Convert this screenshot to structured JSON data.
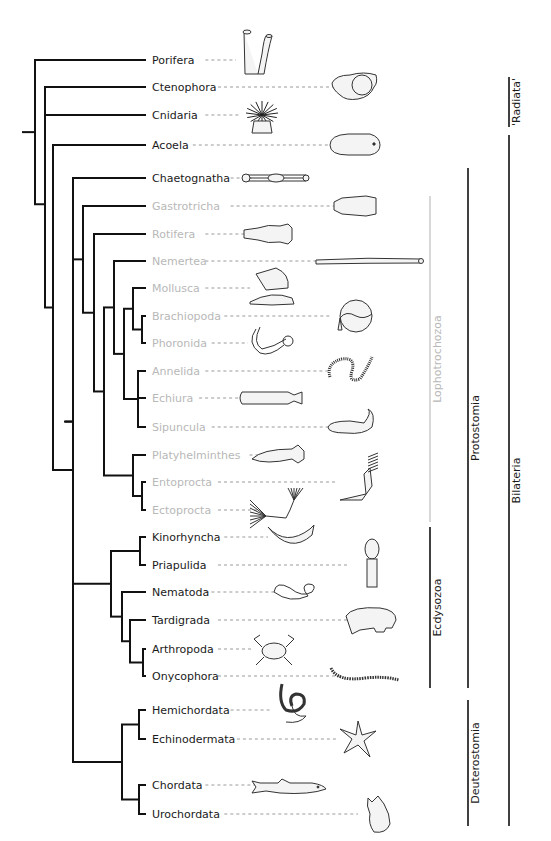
{
  "figure": {
    "type": "phylogenetic-tree",
    "colors": {
      "branch": "#111111",
      "label_dark": "#1a1a1a",
      "label_lophotrochozoa": "#b8b8b8",
      "leader": "#9a9a9a",
      "clade_bar": "#111111",
      "lophotrochozoa_bar": "#d8d8d8",
      "organism_outline": "#333333",
      "organism_fill": "#f4f4f4"
    },
    "taxa": [
      {
        "name": "Porifera",
        "group": "outgroup",
        "organism": "sponge-icon"
      },
      {
        "name": "Ctenophora",
        "group": "outgroup",
        "organism": "comb-jelly-icon"
      },
      {
        "name": "Cnidaria",
        "group": "outgroup",
        "organism": "sea-anemone-icon"
      },
      {
        "name": "Acoela",
        "group": "bilateria",
        "organism": "acoel-flatworm-icon"
      },
      {
        "name": "Chaetognatha",
        "group": "protostomia",
        "organism": "arrow-worm-icon"
      },
      {
        "name": "Gastrotricha",
        "group": "lophotrochozoa",
        "organism": "gastrotrich-icon"
      },
      {
        "name": "Rotifera",
        "group": "lophotrochozoa",
        "organism": "rotifer-icon"
      },
      {
        "name": "Nemertea",
        "group": "lophotrochozoa",
        "organism": "ribbon-worm-icon"
      },
      {
        "name": "Mollusca",
        "group": "lophotrochozoa",
        "organism": "snail-icon"
      },
      {
        "name": "Brachiopoda",
        "group": "lophotrochozoa",
        "organism": "lamp-shell-icon"
      },
      {
        "name": "Phoronida",
        "group": "lophotrochozoa",
        "organism": "horseshoe-worm-icon"
      },
      {
        "name": "Annelida",
        "group": "lophotrochozoa",
        "organism": "segmented-worm-icon"
      },
      {
        "name": "Echiura",
        "group": "lophotrochozoa",
        "organism": "spoon-worm-icon"
      },
      {
        "name": "Sipuncula",
        "group": "lophotrochozoa",
        "organism": "peanut-worm-icon"
      },
      {
        "name": "Platyhelminthes",
        "group": "lophotrochozoa",
        "organism": "flatworm-icon"
      },
      {
        "name": "Entoprocta",
        "group": "lophotrochozoa",
        "organism": "entoproct-icon"
      },
      {
        "name": "Ectoprocta",
        "group": "lophotrochozoa",
        "organism": "bryozoan-icon"
      },
      {
        "name": "Kinorhyncha",
        "group": "ecdysozoa",
        "organism": "mud-dragon-icon"
      },
      {
        "name": "Priapulida",
        "group": "ecdysozoa",
        "organism": "priapulid-icon"
      },
      {
        "name": "Nematoda",
        "group": "ecdysozoa",
        "organism": "roundworm-icon"
      },
      {
        "name": "Tardigrada",
        "group": "ecdysozoa",
        "organism": "water-bear-icon"
      },
      {
        "name": "Arthropoda",
        "group": "ecdysozoa",
        "organism": "crab-icon"
      },
      {
        "name": "Onycophora",
        "group": "ecdysozoa",
        "organism": "velvet-worm-icon"
      },
      {
        "name": "Hemichordata",
        "group": "deuterostomia",
        "organism": "acorn-worm-icon"
      },
      {
        "name": "Echinodermata",
        "group": "deuterostomia",
        "organism": "starfish-icon"
      },
      {
        "name": "Chordata",
        "group": "deuterostomia",
        "organism": "shark-icon"
      },
      {
        "name": "Urochordata",
        "group": "deuterostomia",
        "organism": "sea-squirt-icon"
      }
    ],
    "clades": [
      {
        "name": "'Radiata'",
        "from": "Ctenophora",
        "to": "Cnidaria",
        "column": 3
      },
      {
        "name": "Lophotrochozoa",
        "from": "Gastrotricha",
        "to": "Ectoprocta",
        "column": 1,
        "faded": true
      },
      {
        "name": "Ecdysozoa",
        "from": "Kinorhyncha",
        "to": "Onycophora",
        "column": 1
      },
      {
        "name": "Protostomia",
        "from": "Chaetognatha",
        "to": "Onycophora",
        "column": 2
      },
      {
        "name": "Deuterostomia",
        "from": "Hemichordata",
        "to": "Urochordata",
        "column": 2
      },
      {
        "name": "Bilateria",
        "from": "Acoela",
        "to": "Urochordata",
        "column": 3
      }
    ],
    "topology": "(Porifera,((Ctenophora,Cnidaria),(Acoela,(Chaetognatha,((Gastrotricha,(Rotifera,((Nemertea,((Mollusca,(Brachiopoda,Phoronida)),(Annelida,Echiura,Sipuncula))),(Platyhelminthes,(Entoprocta,Ectoprocta))))),((Kinorhyncha,Priapulida),(Nematoda,(Tardigrada,(Arthropoda,Onycophora))))),((Hemichordata,Echinodermata),(Chordata,Urochordata))))))"
  }
}
